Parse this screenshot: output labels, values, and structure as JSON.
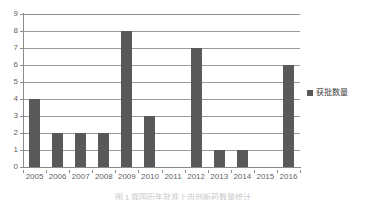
{
  "chart_data": {
    "type": "bar",
    "title": "",
    "xlabel": "",
    "ylabel": "",
    "categories": [
      "2005",
      "2006",
      "2007",
      "2008",
      "2009",
      "2010",
      "2011",
      "2012",
      "2013",
      "2014",
      "2015",
      "2016"
    ],
    "values": [
      4,
      2,
      2,
      2,
      8,
      3,
      0,
      7,
      1,
      1,
      0,
      6
    ],
    "series": [
      {
        "name": "获批数量",
        "values": [
          4,
          2,
          2,
          2,
          8,
          3,
          0,
          7,
          1,
          1,
          0,
          6
        ]
      }
    ],
    "ylim": [
      0,
      9
    ],
    "yticks": [
      "0",
      "1",
      "2",
      "3",
      "4",
      "5",
      "6",
      "7",
      "8",
      "9"
    ],
    "grid": "horizontal",
    "legend_position": "right",
    "bar_color": "#595959",
    "gridline_color": "#9a9a9a",
    "axis_color": "#8a8a8a",
    "tick_label_color": "#5f5f5f"
  },
  "legend": {
    "entries": [
      {
        "label": "获批数量",
        "color": "#595959",
        "marker": "square"
      }
    ]
  },
  "caption": {
    "text": "图 1   我国历年批准上市创新药数量统计"
  }
}
